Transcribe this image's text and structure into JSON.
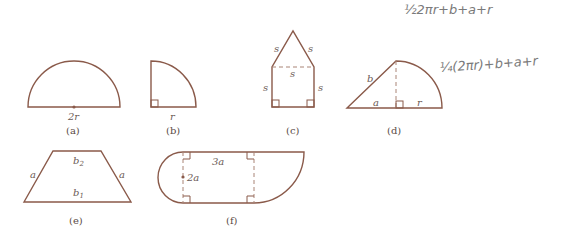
{
  "figures": [
    {
      "id": "a",
      "caption": "(a)",
      "shape": "semicircle",
      "labels": {
        "diameter": "2r"
      }
    },
    {
      "id": "b",
      "caption": "(b)",
      "shape": "quarter-circle",
      "labels": {
        "radius": "r"
      }
    },
    {
      "id": "c",
      "caption": "(c)",
      "shape": "square-with-triangle-roof",
      "labels": {
        "roof_left": "s",
        "roof_right": "s",
        "dashed": "s",
        "left": "s",
        "right": "s"
      }
    },
    {
      "id": "d",
      "caption": "(d)",
      "shape": "triangle-plus-quarter-circle",
      "labels": {
        "hyp": "b",
        "base": "a",
        "radius": "r"
      }
    },
    {
      "id": "e",
      "caption": "(e)",
      "shape": "trapezoid",
      "labels": {
        "top": "b",
        "top_sub": "2",
        "bottom": "b",
        "bottom_sub": "1",
        "left": "a",
        "right": "a"
      }
    },
    {
      "id": "f",
      "caption": "(f)",
      "shape": "rectangle-with-semicircle-and-quarter-circle",
      "labels": {
        "top": "3a",
        "height": "2a"
      }
    }
  ],
  "handwriting": [
    {
      "id": "note-1",
      "text": "½2πr+b+a+r"
    },
    {
      "id": "note-2",
      "text": "¼(2πr)+b+a+r"
    }
  ]
}
